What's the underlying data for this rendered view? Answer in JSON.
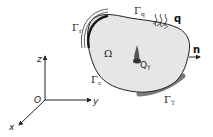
{
  "diagram": {
    "domain_label": "Ω",
    "boundaries": {
      "radiation": {
        "symbol": "Γ",
        "subscript": "r"
      },
      "flux": {
        "symbol": "Γ",
        "subscript": "q"
      },
      "convection": {
        "symbol": "Γ",
        "subscript": "c"
      },
      "temperature": {
        "symbol": "Γ",
        "subscript": "T"
      }
    },
    "flux_label": "q",
    "normal_label": "n",
    "source": {
      "symbol": "Q",
      "subscript": "T"
    },
    "axes": {
      "origin": "O",
      "x": "x",
      "y": "y",
      "z": "z"
    },
    "colors": {
      "domain_fill": "#e6e6e6",
      "outline": "#222222",
      "temperature_boundary": "#7a7a7a",
      "background": "#ffffff"
    }
  }
}
